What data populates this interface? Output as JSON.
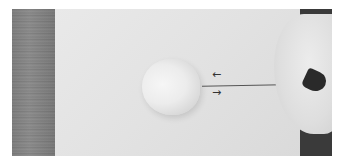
{
  "photo": {
    "description": "Photograph of a hand pushing a felting needle into a ball of white wool on a paper surface, with arrows indicating back-and-forth needle motion",
    "annotations": {
      "arrow_top": "←",
      "arrow_bottom": "→"
    },
    "colors": {
      "paper": "#e4e4e4",
      "wood": "#848484",
      "background_right": "#3a3a3a",
      "wool": "#ececec"
    }
  }
}
